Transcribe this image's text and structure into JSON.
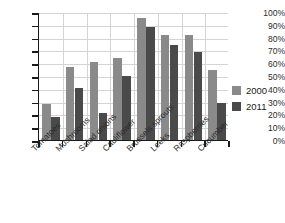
{
  "chart_data": {
    "type": "bar",
    "title": "",
    "subtitle": "",
    "xlabel": "",
    "ylabel": "",
    "ylim": [
      0,
      100
    ],
    "y_tick_labels": [
      "100%",
      "90%",
      "80%",
      "70%",
      "60%",
      "50%",
      "40%",
      "30%",
      "20%",
      "10%",
      "0%"
    ],
    "y_tick_values": [
      100,
      90,
      80,
      70,
      60,
      50,
      40,
      30,
      20,
      10,
      0
    ],
    "grid": true,
    "grid_axis": "both",
    "legend_position": "right",
    "value_unit": "%",
    "categories": [
      "Tomatoes",
      "Mushrooms",
      "Salad onions",
      "Cauliflower",
      "Brussels sprouts",
      "Leeks",
      "Raspberries",
      "Cucumber"
    ],
    "series": [
      {
        "name": "2000",
        "color": "#8a8a8a",
        "values": [
          28,
          57,
          61,
          64,
          95,
          82,
          82,
          55
        ]
      },
      {
        "name": "2011",
        "color": "#4a4a4a",
        "values": [
          18,
          41,
          21,
          50,
          88,
          74,
          69,
          29
        ]
      }
    ]
  },
  "legend": {
    "items": [
      {
        "label": "2000",
        "color": "#8a8a8a"
      },
      {
        "label": "2011",
        "color": "#4a4a4a"
      }
    ]
  },
  "colors": {
    "series_2000": "#8a8a8a",
    "series_2011": "#4a4a4a",
    "axis": "#1a1a1a",
    "gridline": "#d4d4d4",
    "background": "#ffffff",
    "text": "#2b2b2b"
  }
}
